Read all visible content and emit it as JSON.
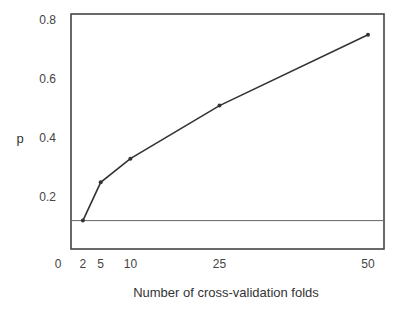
{
  "chart_data": {
    "type": "line",
    "title": "",
    "xlabel": "Number of cross-validation folds",
    "ylabel": "p",
    "x": [
      2,
      5,
      10,
      25,
      50
    ],
    "series": [
      {
        "name": "p",
        "values": [
          0.12,
          0.25,
          0.33,
          0.51,
          0.75
        ]
      }
    ],
    "reference_line": {
      "type": "horizontal",
      "y": 0.12
    },
    "x_ticks": [
      0,
      2,
      5,
      10,
      25,
      50
    ],
    "x_tick_labels": [
      "0",
      "2",
      "5",
      "10",
      "25",
      "50"
    ],
    "y_ticks": [
      0.2,
      0.4,
      0.6,
      0.8
    ],
    "y_tick_labels": [
      "0.2",
      "0.4",
      "0.6",
      "0.8"
    ],
    "xlim": [
      0,
      52
    ],
    "ylim": [
      0.02,
      0.82
    ],
    "grid": false,
    "legend": null
  },
  "colors": {
    "line": "#333333",
    "frame": "#444444",
    "reference": "#666666"
  }
}
